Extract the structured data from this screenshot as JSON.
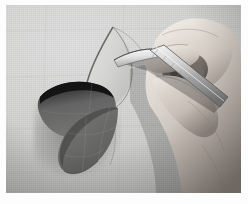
{
  "image": {
    "title": "Hand cutting paper petal shapes with a craft scalpel",
    "medium": "black and white photograph",
    "orientation": "landscape",
    "border": {
      "style": "white photographic print border",
      "color": "#fdfdfd",
      "top_px": 5,
      "right_px": 7,
      "bottom_px": 11,
      "left_px": 6
    },
    "palette": {
      "border_white": "#fdfdfd",
      "background_light": "#dedede",
      "background_mid": "#cfcfce",
      "background_dark": "#b4b4b3",
      "paper_dark_grey": "#6f6f6f",
      "paper_dark_shade": "#4c4c4c",
      "paper_curl_black": "#1c1c1c",
      "skin_light": "#e6e1dc",
      "skin_mid": "#bdb5ad",
      "skin_shadow": "#736b64",
      "blade_metal": "#e9e9e9",
      "handle_metal": "#b9b9b9",
      "handle_outline": "#5a5a5a",
      "pencil_line": "#9a9a9a"
    }
  },
  "subjects": {
    "background": {
      "name": "work surface sheet",
      "description": "large pale grey sheet of paper filling the frame, lit from upper left",
      "guide_lines": "faint pencil construction lines"
    },
    "cut_shapes": {
      "name": "two dark paper petals",
      "description": "two dark grey leaf shapes arranged in an S / yin-yang curl near the left of centre",
      "count": 2,
      "upper_petal": {
        "name": "upper petal",
        "note": "curled edge catching deep shadow along its top rim"
      },
      "lower_petal": {
        "name": "lower petal",
        "note": "lying flat, ruled with faint pencil grid lines"
      }
    },
    "outline_shape": {
      "name": "scored petal outline",
      "description": "pointed leaf outline scored into the light sheet above the dark petals, partly lifted"
    },
    "hand": {
      "name": "right hand",
      "description": "hand entering from the upper right, fingers curled, gripping the knife",
      "fingers_visible": 4
    },
    "tool": {
      "name": "craft scalpel",
      "description": "slim metal scalpel with a pointed blade, angled down and to the left",
      "blade": "pointed steel blade at the lower left end",
      "handle": "long flat knurled metal handle"
    }
  },
  "lighting": {
    "direction": "from upper left",
    "shadow_direction": "to the lower right",
    "contrast": "medium"
  }
}
